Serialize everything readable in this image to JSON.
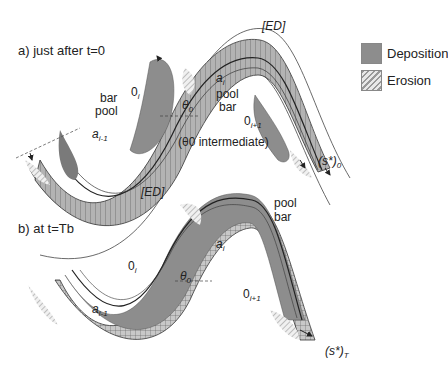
{
  "legend": {
    "items": [
      {
        "label": "Deposition",
        "pattern": "solid-gray",
        "color": "#8d8d8d"
      },
      {
        "label": "Erosion",
        "pattern": "diagonal-hatch",
        "color": "#999999"
      }
    ]
  },
  "panel_a": {
    "title": "a)  just after t=0",
    "labels": {
      "ed_top": "[ED]",
      "ed_bottom": "[ED]",
      "bar_left": "bar",
      "pool_left": "pool",
      "zero_i": "0",
      "zero_i_sub": "i",
      "theta0": "θ",
      "theta0_sub": "0",
      "a_im1": "a",
      "a_im1_sub": "i-1",
      "a_i": "a",
      "a_i_sub": "i",
      "pool_right": "pool",
      "bar_right": "bar",
      "zero_ip1": "0",
      "zero_ip1_sub": "i+1",
      "theta_note": "(θ0 intermediate)",
      "s_star": "(s*)",
      "s_star_sub": "0"
    }
  },
  "panel_b": {
    "title": "b)  at t=Tb",
    "labels": {
      "pool": "pool",
      "bar": "bar",
      "a_i": "a",
      "a_i_sub": "i",
      "zero_i": "0",
      "zero_i_sub": "i",
      "theta0": "θ",
      "theta0_sub": "0",
      "a_im1": "a",
      "a_im1_sub": "i-1",
      "zero_ip1": "0",
      "zero_ip1_sub": "i+1",
      "s_star": "(s*)",
      "s_star_sub": "T"
    }
  }
}
